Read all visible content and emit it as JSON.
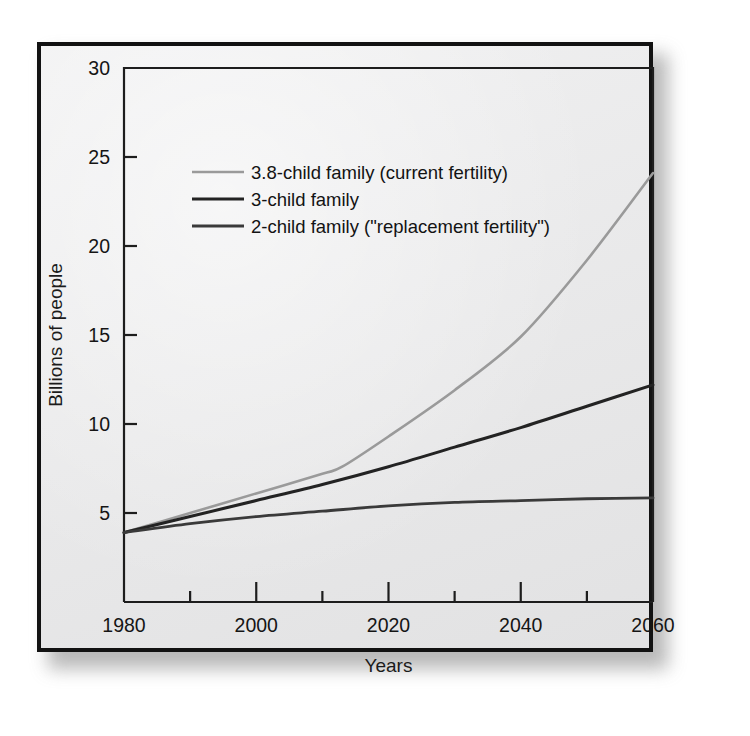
{
  "figure": {
    "background_color": "#ececed",
    "frame_color": "#121212"
  },
  "chart_data": {
    "type": "line",
    "title": "",
    "xlabel": "Years",
    "ylabel": "Billions of people",
    "xlim": [
      1980,
      2060
    ],
    "ylim": [
      0,
      30
    ],
    "x_major_ticks": [
      1980,
      2000,
      2020,
      2040,
      2060
    ],
    "x_minor_ticks": [
      1990,
      2010,
      2030,
      2050
    ],
    "x_tick_labels": [
      "1980",
      "2000",
      "2020",
      "2040",
      "2060"
    ],
    "y_ticks": [
      5,
      10,
      15,
      20,
      25,
      30
    ],
    "y_tick_labels": [
      "5",
      "10",
      "15",
      "20",
      "25",
      "30"
    ],
    "grid": false,
    "legend_position": "upper-left-inside",
    "series": [
      {
        "name": "3.8-child family (current fertility)",
        "color": "#9a9a9a",
        "width": 2.6,
        "x": [
          1980,
          1990,
          2000,
          2010,
          2013,
          2020,
          2030,
          2040,
          2050,
          2060
        ],
        "y": [
          3.9,
          5.0,
          6.1,
          7.2,
          7.6,
          9.3,
          11.9,
          14.9,
          19.2,
          24.1
        ]
      },
      {
        "name": "3-child family",
        "color": "#232323",
        "width": 3.0,
        "x": [
          1980,
          1990,
          2000,
          2010,
          2020,
          2030,
          2040,
          2050,
          2060
        ],
        "y": [
          3.9,
          4.8,
          5.7,
          6.6,
          7.6,
          8.7,
          9.8,
          11.0,
          12.2
        ]
      },
      {
        "name": "2-child family (\"replacement fertility\")",
        "color": "#3a3a3a",
        "width": 2.8,
        "x": [
          1980,
          1990,
          2000,
          2010,
          2020,
          2030,
          2040,
          2050,
          2060
        ],
        "y": [
          3.9,
          4.4,
          4.8,
          5.1,
          5.4,
          5.6,
          5.7,
          5.8,
          5.85
        ]
      }
    ]
  }
}
